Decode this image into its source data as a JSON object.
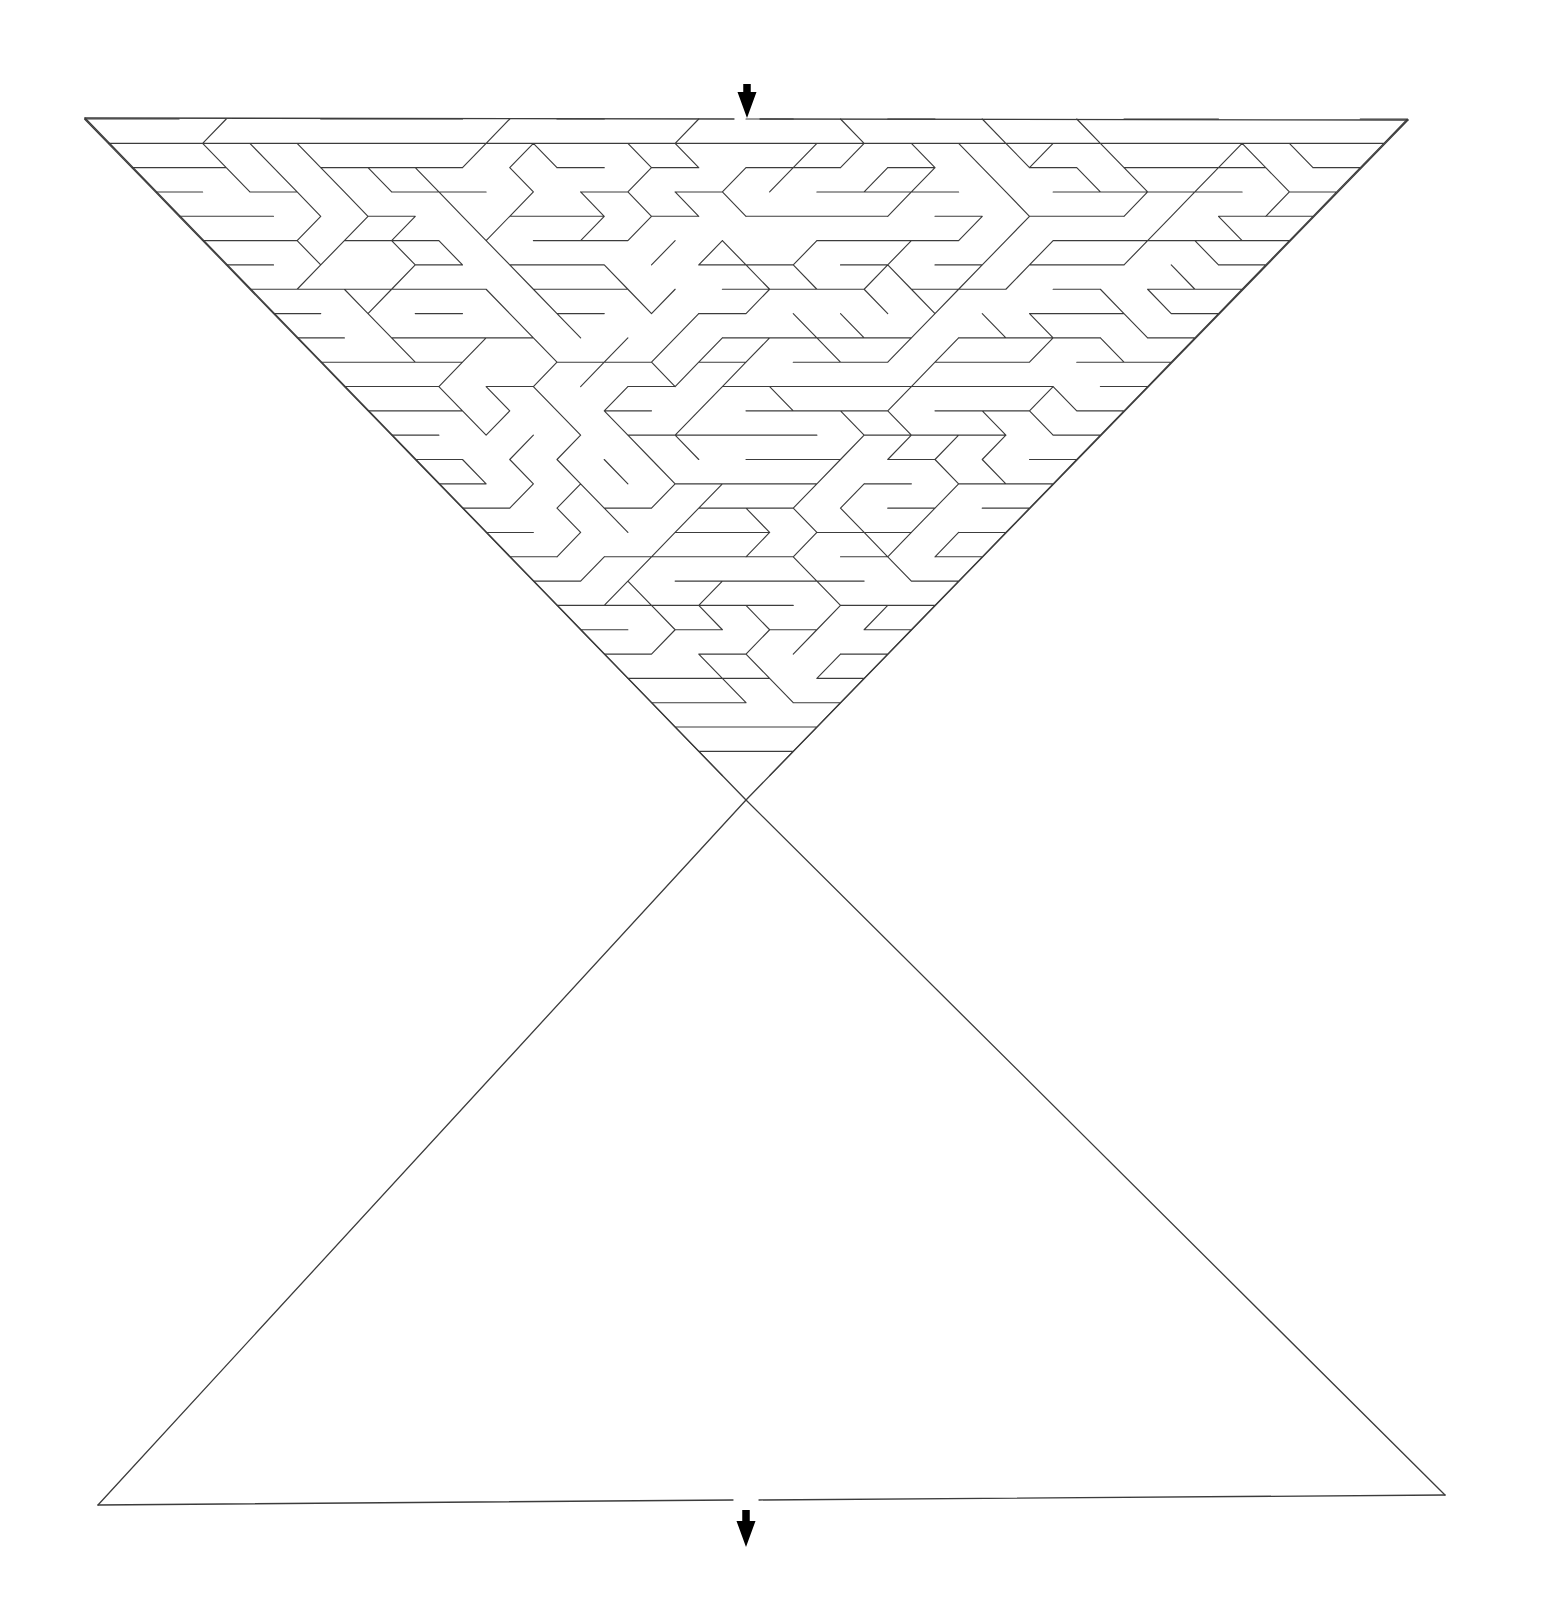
{
  "document": {
    "title": "Hourglass Triangular-Grid Maze",
    "kind": "printable-maze-puzzle",
    "background_color": "#ffffff",
    "width": 1543,
    "height": 1624
  },
  "maze": {
    "shape_name": "hourglass",
    "description": "Two opposed equilateral triangles meeting at a central waist point",
    "lattice": "triangular",
    "wall_color": "#3c3c3c",
    "wall_width": 1.15,
    "border_color": "#3c3c3c",
    "border_width": 1.3,
    "cell_pitch_x": 28.1,
    "rows_upper": 28,
    "rows_lower": 29,
    "geometry": {
      "top_left": [
        85,
        118
      ],
      "top_right": [
        1408,
        120
      ],
      "waist_center": [
        746,
        800
      ],
      "bottom_left": [
        98,
        1505
      ],
      "bottom_right": [
        1445,
        1495
      ]
    },
    "seed": 20250114
  },
  "entrance": {
    "label": "entrance",
    "icon": "arrow-down-icon",
    "color": "#000000",
    "x": 747,
    "y_tip": 118,
    "y_tail": 84,
    "gap_half_width": 13
  },
  "exit": {
    "label": "exit",
    "icon": "arrow-down-icon",
    "color": "#000000",
    "x": 746,
    "y_tip": 1547,
    "y_tail": 1510,
    "gap_half_width": 13
  }
}
